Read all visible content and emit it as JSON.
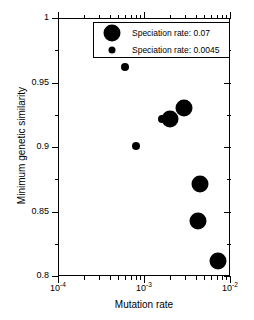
{
  "chart_data": {
    "type": "scatter",
    "title": "",
    "xlabel": "Mutation rate",
    "ylabel": "Minimum genetic similarity",
    "xscale": "log",
    "yscale": "linear",
    "xlim": [
      0.0001,
      0.01
    ],
    "ylim": [
      0.8,
      1.0
    ],
    "grid": false,
    "legend_position": "top-center",
    "xticks": [
      {
        "value": 0.0001,
        "label_mantissa": "10",
        "label_exponent": "-4"
      },
      {
        "value": 0.001,
        "label_mantissa": "10",
        "label_exponent": "-3"
      },
      {
        "value": 0.01,
        "label_mantissa": "10",
        "label_exponent": "-2"
      }
    ],
    "yticks": [
      {
        "value": 0.8,
        "label": "0.8"
      },
      {
        "value": 0.85,
        "label": "0.85"
      },
      {
        "value": 0.9,
        "label": "0.9"
      },
      {
        "value": 0.95,
        "label": "0.95"
      },
      {
        "value": 1.0,
        "label": "1"
      }
    ],
    "ytick_minor": [
      0.825,
      0.875,
      0.925,
      0.975
    ],
    "series": [
      {
        "name": "Speciation rate: 0.07",
        "legend_label": "Speciation rate: 0.07",
        "speciation_rate": 0.07,
        "marker": "circle",
        "marker_size_px": 17,
        "color": "#000000",
        "points": [
          {
            "x": 0.002,
            "y": 0.922
          },
          {
            "x": 0.0029,
            "y": 0.93
          },
          {
            "x": 0.0045,
            "y": 0.871
          },
          {
            "x": 0.0043,
            "y": 0.843
          },
          {
            "x": 0.0072,
            "y": 0.812
          }
        ]
      },
      {
        "name": "Speciation rate: 0.0045",
        "legend_label": "Speciation rate: 0.0045",
        "speciation_rate": 0.0045,
        "marker": "circle",
        "marker_size_px": 8,
        "color": "#000000",
        "points": [
          {
            "x": 0.0006,
            "y": 0.962
          },
          {
            "x": 0.0008,
            "y": 0.901
          },
          {
            "x": 0.0016,
            "y": 0.922
          }
        ]
      }
    ],
    "legend": {
      "entries": [
        {
          "label": "Speciation rate: 0.07",
          "marker_size_px": 17
        },
        {
          "label": "Speciation rate: 0.0045",
          "marker_size_px": 7
        }
      ]
    }
  }
}
